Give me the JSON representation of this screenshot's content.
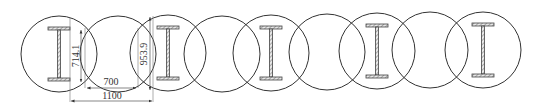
{
  "diagram": {
    "colors": {
      "stroke": "#333333",
      "background": "#ffffff"
    },
    "circle_radius": 38,
    "circles": [
      {
        "cx": 59,
        "cy": 54,
        "has_ibeam": true
      },
      {
        "cx": 118,
        "cy": 54,
        "has_ibeam": false
      },
      {
        "cx": 168,
        "cy": 53,
        "has_ibeam": true
      },
      {
        "cx": 222,
        "cy": 54,
        "has_ibeam": false
      },
      {
        "cx": 271,
        "cy": 53,
        "has_ibeam": true
      },
      {
        "cx": 327,
        "cy": 52,
        "has_ibeam": false
      },
      {
        "cx": 377,
        "cy": 51,
        "has_ibeam": true
      },
      {
        "cx": 430,
        "cy": 50,
        "has_ibeam": false
      },
      {
        "cx": 483,
        "cy": 50,
        "has_ibeam": true
      }
    ],
    "dimensions": {
      "chord_left": "714.1",
      "chord_right": "953.9",
      "inner_span": "700",
      "pile_spacing": "1100"
    }
  }
}
